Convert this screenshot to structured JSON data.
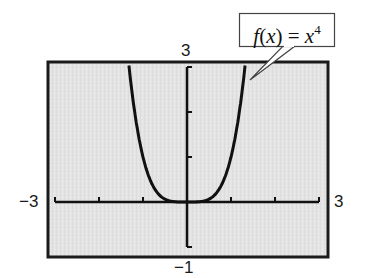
{
  "chart_data": {
    "type": "line",
    "title": "",
    "function": "f(x) = x^4",
    "annotation": {
      "text_func": "f",
      "text_arg": "x",
      "text_eq": " = ",
      "text_base": "x",
      "text_exp": "4"
    },
    "xlabel": "",
    "ylabel": "",
    "xlim": [
      -3,
      3
    ],
    "ylim": [
      -1,
      3
    ],
    "x_tick_step": 1,
    "y_tick_step": 1,
    "window_labels": {
      "xmin": "−3",
      "xmax": "3",
      "ymin": "−1",
      "ymax": "3"
    },
    "grid": false,
    "legend": null,
    "series": [
      {
        "name": "f(x) = x^4",
        "x": [
          -1.316,
          -1.25,
          -1.2,
          -1.1,
          -1.0,
          -0.9,
          -0.8,
          -0.7,
          -0.6,
          -0.5,
          -0.4,
          -0.3,
          -0.2,
          -0.1,
          0,
          0.1,
          0.2,
          0.3,
          0.4,
          0.5,
          0.6,
          0.7,
          0.8,
          0.9,
          1.0,
          1.1,
          1.2,
          1.25,
          1.316
        ],
        "values": [
          3.0,
          2.441,
          2.074,
          1.464,
          1.0,
          0.656,
          0.41,
          0.24,
          0.13,
          0.063,
          0.026,
          0.008,
          0.002,
          0.0,
          0,
          0.0,
          0.002,
          0.008,
          0.026,
          0.063,
          0.13,
          0.24,
          0.41,
          0.656,
          1.0,
          1.464,
          2.074,
          2.441,
          3.0
        ]
      }
    ],
    "colors": {
      "screen_bg": "#e6e6e6",
      "frame": "#1a1a1a",
      "curve": "#111111",
      "axes": "#111111"
    }
  }
}
